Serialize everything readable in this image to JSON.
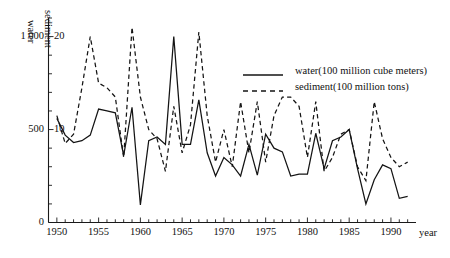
{
  "chart_data": {
    "type": "line",
    "title": "",
    "xlabel": "year",
    "ylabel_left": "water",
    "ylabel_right": "sediment",
    "x": [
      1950,
      1951,
      1952,
      1953,
      1954,
      1955,
      1956,
      1957,
      1958,
      1959,
      1960,
      1961,
      1962,
      1963,
      1964,
      1965,
      1966,
      1967,
      1968,
      1969,
      1970,
      1971,
      1972,
      1973,
      1974,
      1975,
      1976,
      1977,
      1978,
      1979,
      1980,
      1981,
      1982,
      1983,
      1984,
      1985,
      1986,
      1987,
      1988,
      1989,
      1990,
      1991,
      1992
    ],
    "xlim": [
      1949,
      1993
    ],
    "xticks": [
      1950,
      1955,
      1960,
      1965,
      1970,
      1975,
      1980,
      1985,
      1990
    ],
    "xtick_labels": [
      "1950",
      "1955",
      "1960",
      "1965",
      "1970",
      "1975",
      "1980",
      "1985",
      "1990"
    ],
    "xtick_step_minor": 1,
    "grid": false,
    "legend_position": "upper-right",
    "axis_left": {
      "name": "water",
      "unit": "100 million cube meters",
      "ticks": [
        0,
        500,
        1000
      ],
      "tick_labels": [
        "0",
        "500",
        "1 000"
      ],
      "minor_tick_step": 100,
      "ylim": [
        0,
        1100
      ]
    },
    "axis_right": {
      "name": "sediment",
      "unit": "100 million tons",
      "ticks": [
        10,
        20
      ],
      "tick_labels": [
        "10",
        "20"
      ],
      "minor_tick_step": 2,
      "ylim": [
        0,
        22
      ]
    },
    "series": [
      {
        "name": "water(100 million cube meters)",
        "short_name": "water",
        "axis": "left",
        "style": "solid",
        "unit": "100 million cube meters",
        "values": [
          560,
          470,
          430,
          440,
          470,
          610,
          600,
          590,
          360,
          620,
          95,
          440,
          460,
          420,
          1000,
          420,
          420,
          660,
          375,
          250,
          350,
          310,
          250,
          420,
          255,
          475,
          400,
          380,
          250,
          260,
          260,
          480,
          290,
          440,
          460,
          500,
          290,
          100,
          230,
          310,
          290,
          130,
          140
        ]
      },
      {
        "name": "sediment(100 million tons)",
        "short_name": "sediment",
        "axis": "right",
        "style": "dashed",
        "unit": "100 million tons",
        "values": [
          11.5,
          8.5,
          9.5,
          14.5,
          20.0,
          15.0,
          14.5,
          13.5,
          7.0,
          21.0,
          13.5,
          10.0,
          9.0,
          5.5,
          12.5,
          7.5,
          10.5,
          20.5,
          11.5,
          6.5,
          10.0,
          6.0,
          13.0,
          7.5,
          13.0,
          6.5,
          11.5,
          13.5,
          13.5,
          12.5,
          7.0,
          13.0,
          5.5,
          7.0,
          9.5,
          10.0,
          6.0,
          4.5,
          13.0,
          9.0,
          7.0,
          6.0,
          6.5
        ]
      }
    ]
  },
  "legend": {
    "items": [
      {
        "label": "water(100 million cube meters)",
        "style": "solid"
      },
      {
        "label": "sediment(100 million tons)",
        "style": "dashed"
      }
    ]
  }
}
